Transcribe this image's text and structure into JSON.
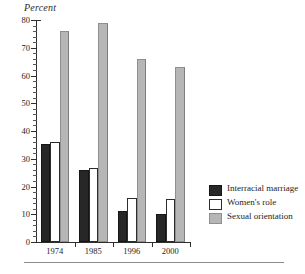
{
  "chart_data": {
    "type": "bar",
    "title": "",
    "subtitle": "",
    "xlabel": "",
    "ylabel": "Percent",
    "categories": [
      "1974",
      "1985",
      "1996",
      "2000"
    ],
    "series": [
      {
        "name": "Interracial marriage",
        "values": [
          35.5,
          26,
          11,
          10
        ],
        "color": "#272727"
      },
      {
        "name": "Women's role",
        "values": [
          36,
          26.5,
          16,
          15.5
        ],
        "color": "#ffffff"
      },
      {
        "name": "Sexual orientation",
        "values": [
          76,
          79,
          66,
          63
        ],
        "color": "#b6b6b6"
      }
    ],
    "ylim": [
      0,
      80
    ],
    "y_major_ticks": [
      0,
      10,
      20,
      30,
      40,
      50,
      60,
      70,
      80
    ],
    "y_tick_labels": [
      "0",
      "10",
      "20",
      "30",
      "40",
      "50",
      "60",
      "70",
      "80"
    ],
    "y_minor_tick_step": 2,
    "grid": false,
    "legend_position": "right"
  },
  "axis": {
    "y_title": "Percent"
  },
  "legend": {
    "items": [
      {
        "label": "Interracial marriage",
        "swatch": "dark-swatch"
      },
      {
        "label": "Women's role",
        "swatch": "white-swatch"
      },
      {
        "label": "Sexual orientation",
        "swatch": "gray-swatch"
      }
    ]
  }
}
